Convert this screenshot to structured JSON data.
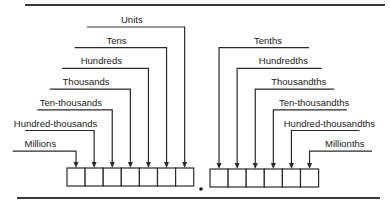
{
  "diagram": {
    "whole_places": [
      {
        "label": "Units"
      },
      {
        "label": "Tens"
      },
      {
        "label": "Hundreds"
      },
      {
        "label": "Thousands"
      },
      {
        "label": "Ten-thousands"
      },
      {
        "label": "Hundred-thousands"
      },
      {
        "label": "Millions"
      }
    ],
    "decimal_places": [
      {
        "label": "Tenths"
      },
      {
        "label": "Hundredths"
      },
      {
        "label": "Thousandths"
      },
      {
        "label": "Ten-thousandths"
      },
      {
        "label": "Hundred-thousandths"
      },
      {
        "label": "Millionths"
      }
    ],
    "decimal_point": "."
  }
}
